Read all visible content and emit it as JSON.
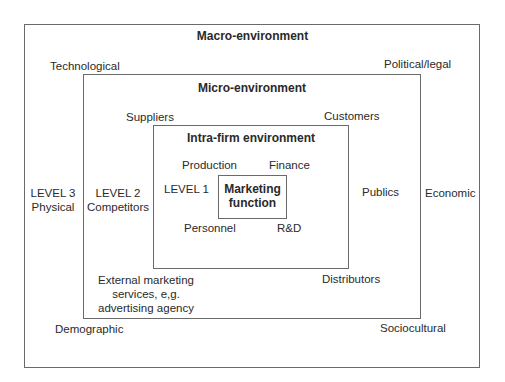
{
  "macro": {
    "title": "Macro-environment",
    "level_line1": "LEVEL 3",
    "level_line2": "Physical",
    "factors": {
      "top_left": "Technological",
      "top_right": "Political/legal",
      "right": "Economic",
      "bottom_left": "Demographic",
      "bottom_right": "Sociocultural"
    }
  },
  "micro": {
    "title": "Micro-environment",
    "level_line1": "LEVEL 2",
    "level_line2": "Competitors",
    "actors": {
      "top_left": "Suppliers",
      "top_right": "Customers",
      "right": "Publics",
      "bottom_right": "Distributors",
      "bottom_left_line1": "External marketing",
      "bottom_left_line2": "services, e,g.",
      "bottom_left_line3": "advertising agency"
    }
  },
  "intra": {
    "title": "Intra-firm environment",
    "level": "LEVEL 1",
    "departments": {
      "top_left": "Production",
      "top_right": "Finance",
      "bottom_left": "Personnel",
      "bottom_right": "R&D"
    }
  },
  "core": {
    "line1": "Marketing",
    "line2": "function"
  }
}
